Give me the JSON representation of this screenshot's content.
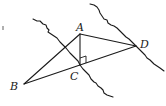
{
  "diagram": {
    "type": "geometry",
    "colors": {
      "stroke": "#1a1a1a",
      "background": "#ffffff"
    },
    "points": {
      "A": {
        "label": "A",
        "x": 80,
        "y": 34
      },
      "B": {
        "label": "B",
        "x": 24,
        "y": 84
      },
      "C": {
        "label": "C",
        "x": 80,
        "y": 65
      },
      "D": {
        "label": "D",
        "x": 136,
        "y": 46
      }
    },
    "segments": [
      "AB",
      "AC",
      "AD",
      "BC",
      "BD"
    ],
    "right_angle_at": "C",
    "right_angle_between": [
      "CA",
      "CD"
    ],
    "wavy_lines": [
      {
        "name": "wavy-line-through-c",
        "from": [
          33,
          19
        ],
        "to": [
          113,
          97
        ]
      },
      {
        "name": "wavy-line-through-d",
        "from": [
          90,
          4
        ],
        "to": [
          164,
          71
        ]
      }
    ],
    "labels": {
      "A": "A",
      "B": "B",
      "C": "C",
      "D": "D"
    }
  }
}
